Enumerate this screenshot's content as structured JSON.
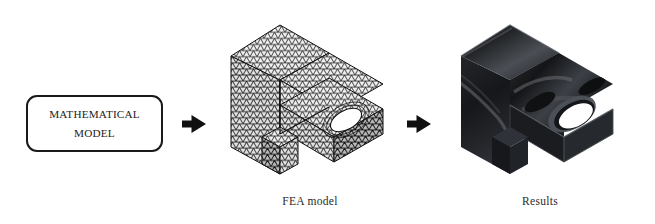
{
  "figure": {
    "background_color": "#ffffff",
    "width": 655,
    "height": 224
  },
  "mathematical_model": {
    "line1": "MATHEMATICAL",
    "line2": "MODEL",
    "border_color": "#1a1a1a",
    "fill_color": "#ffffff"
  },
  "arrows": [
    {
      "name": "arrow-to-fea",
      "direction": "right",
      "color": "#101010"
    },
    {
      "name": "arrow-to-results",
      "direction": "right",
      "color": "#101010"
    }
  ],
  "stages": [
    {
      "name": "fea-model",
      "caption": "FEA model",
      "description": "isometric L-bracket with triangular finite element mesh",
      "mesh_color": "#1e1e1e",
      "face_color": "#d8d8d8"
    },
    {
      "name": "results",
      "caption": "Results",
      "description": "shaded isometric L-bracket solution contour plot",
      "body_color": "#1b1c1e",
      "highlight_color": "#5e6166"
    }
  ]
}
